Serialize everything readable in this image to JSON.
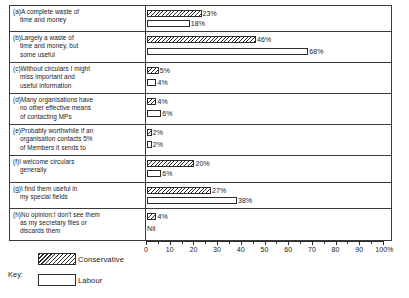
{
  "chart_data": {
    "type": "bar",
    "orientation": "horizontal",
    "title": "",
    "xlabel": "",
    "ylabel": "",
    "xlim": [
      0,
      100
    ],
    "x_unit": "%",
    "grid": false,
    "axis_ticks": [
      0,
      10,
      20,
      30,
      40,
      50,
      60,
      70,
      80,
      90,
      100
    ],
    "axis_tick_labels": [
      "0",
      "10",
      "20",
      "30",
      "40",
      "50",
      "60",
      "70",
      "80",
      "90",
      "100%"
    ],
    "minor_tick_step": 5,
    "legend_position": "bottom-left",
    "legend_title": "Key:",
    "series": [
      {
        "name": "Conservative",
        "fill": "hatched",
        "values": [
          23,
          46,
          5,
          4,
          2,
          20,
          27,
          4
        ],
        "labels": [
          "23%",
          "46%",
          "5%",
          "4%",
          "2%",
          "20%",
          "27%",
          "4%"
        ]
      },
      {
        "name": "Labour",
        "fill": "open",
        "values": [
          18,
          68,
          4,
          6,
          2,
          6,
          38,
          0
        ],
        "labels": [
          "18%",
          "68%",
          "4%",
          "6%",
          "2%",
          "6%",
          "38%",
          "Nil"
        ]
      }
    ],
    "categories": [
      "(a)A complete waste of time and money",
      "(b)Largely a waste of time and money, but some useful",
      "(c)Without circulars I might miss important and useful information",
      "(d)Many organisations have no other effective means of contacting MPs",
      "(e)Probably worthwhile if an organisation contacts 5% of Members it sends to",
      "(f)I welcome circulars generally",
      "(g)I find them useful in my special fields",
      "(h)No opinion:I don't see them as my secretary files or discards them"
    ]
  },
  "rows": [
    {
      "id": "a",
      "lines": [
        "(a)A complete waste of",
        "time and money"
      ],
      "cons_value": 23,
      "cons_label": "23%",
      "lab_value": 18,
      "lab_label": "18%"
    },
    {
      "id": "b",
      "lines": [
        "(b)Largely a waste of",
        "time and money, but",
        "some useful"
      ],
      "cons_value": 46,
      "cons_label": "46%",
      "lab_value": 68,
      "lab_label": "68%"
    },
    {
      "id": "c",
      "lines": [
        "(c)Without circulars I might",
        "miss important and",
        "useful information"
      ],
      "cons_value": 5,
      "cons_label": "5%",
      "lab_value": 4,
      "lab_label": "4%"
    },
    {
      "id": "d",
      "lines": [
        "(d)Many organisations have",
        "no other effective means",
        "of contacting MPs"
      ],
      "cons_value": 4,
      "cons_label": "4%",
      "lab_value": 6,
      "lab_label": "6%"
    },
    {
      "id": "e",
      "lines": [
        "(e)Probably worthwhile if an",
        "organisation contacts 5%",
        "of Members it sends to"
      ],
      "cons_value": 2,
      "cons_label": "2%",
      "lab_value": 2,
      "lab_label": "2%"
    },
    {
      "id": "f",
      "lines": [
        "(f)I welcome circulars",
        "generally"
      ],
      "cons_value": 20,
      "cons_label": "20%",
      "lab_value": 6,
      "lab_label": "6%"
    },
    {
      "id": "g",
      "lines": [
        "(g)I find them useful in",
        "my special fields"
      ],
      "cons_value": 27,
      "cons_label": "27%",
      "lab_value": 38,
      "lab_label": "38%"
    },
    {
      "id": "h",
      "lines": [
        "(h)No opinion:I don't see them",
        "as my secretary files or",
        "discards them"
      ],
      "cons_value": 4,
      "cons_label": "4%",
      "lab_value": 0,
      "lab_label": "Nil"
    }
  ],
  "axis": {
    "ticks": [
      "0",
      "10",
      "20",
      "30",
      "40",
      "50",
      "60",
      "70",
      "80",
      "90",
      "100%"
    ]
  },
  "key": {
    "word": "Key:",
    "items": [
      {
        "label": "Conservative",
        "fill": "hatched"
      },
      {
        "label": "Labour",
        "fill": "open"
      }
    ]
  },
  "colors": {
    "ink": "#2b2b2b",
    "paper": "#ffffff"
  }
}
